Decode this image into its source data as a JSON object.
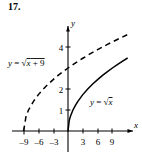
{
  "figure": {
    "problem_number": "17.",
    "background_color": "#ffffff",
    "ink_color": "#000000"
  },
  "chart_data": {
    "type": "line",
    "title": "",
    "xlabel": "x",
    "ylabel": "y",
    "xlim": [
      -11,
      13
    ],
    "ylim": [
      -0.8,
      5.2
    ],
    "grid": false,
    "legend": "inline-annotations",
    "x_ticks": [
      -9,
      -6,
      -3,
      3,
      6,
      9
    ],
    "x_tick_labels": [
      "–9",
      "–6",
      "–3",
      "3",
      "6",
      "9"
    ],
    "y_ticks": [
      1,
      2,
      4
    ],
    "y_tick_labels": [
      "1",
      "2",
      "4"
    ],
    "series": [
      {
        "name": "y = √(x + 9)",
        "label_text": "y = √x + 9",
        "label_lhs": "y",
        "label_eq": " = ",
        "label_radicand": "x + 9",
        "style": "dashed",
        "domain": [
          -9,
          12
        ],
        "points": [
          {
            "x": -9,
            "y": 0
          },
          {
            "x": -8.5,
            "y": 0.707
          },
          {
            "x": -8,
            "y": 1.0
          },
          {
            "x": -7,
            "y": 1.414
          },
          {
            "x": -6,
            "y": 1.732
          },
          {
            "x": -5,
            "y": 2.0
          },
          {
            "x": -4,
            "y": 2.236
          },
          {
            "x": -3,
            "y": 2.449
          },
          {
            "x": -2,
            "y": 2.646
          },
          {
            "x": -1,
            "y": 2.828
          },
          {
            "x": 0,
            "y": 3.0
          },
          {
            "x": 1,
            "y": 3.162
          },
          {
            "x": 2,
            "y": 3.317
          },
          {
            "x": 3,
            "y": 3.464
          },
          {
            "x": 4,
            "y": 3.606
          },
          {
            "x": 5,
            "y": 3.742
          },
          {
            "x": 6,
            "y": 3.873
          },
          {
            "x": 7,
            "y": 4.0
          },
          {
            "x": 8,
            "y": 4.123
          },
          {
            "x": 9,
            "y": 4.243
          },
          {
            "x": 10,
            "y": 4.359
          },
          {
            "x": 11,
            "y": 4.472
          },
          {
            "x": 12,
            "y": 4.583
          }
        ]
      },
      {
        "name": "y = √x",
        "label_text": "y = √x",
        "label_lhs": "y",
        "label_eq": " = ",
        "label_radicand": "x",
        "style": "solid",
        "domain": [
          0,
          12
        ],
        "points": [
          {
            "x": 0,
            "y": 0
          },
          {
            "x": 0.25,
            "y": 0.5
          },
          {
            "x": 0.5,
            "y": 0.707
          },
          {
            "x": 1,
            "y": 1.0
          },
          {
            "x": 1.5,
            "y": 1.225
          },
          {
            "x": 2,
            "y": 1.414
          },
          {
            "x": 3,
            "y": 1.732
          },
          {
            "x": 4,
            "y": 2.0
          },
          {
            "x": 5,
            "y": 2.236
          },
          {
            "x": 6,
            "y": 2.449
          },
          {
            "x": 7,
            "y": 2.646
          },
          {
            "x": 8,
            "y": 2.828
          },
          {
            "x": 9,
            "y": 3.0
          },
          {
            "x": 10,
            "y": 3.162
          },
          {
            "x": 11,
            "y": 3.317
          },
          {
            "x": 12,
            "y": 3.464
          }
        ]
      }
    ],
    "annotations": [
      {
        "name": "label-sqrt-x-plus-9",
        "text": "y = √x + 9",
        "x_px": 8,
        "y_px": 66
      },
      {
        "name": "label-sqrt-x",
        "text": "y = √x",
        "x_px": 90,
        "y_px": 105
      }
    ]
  }
}
